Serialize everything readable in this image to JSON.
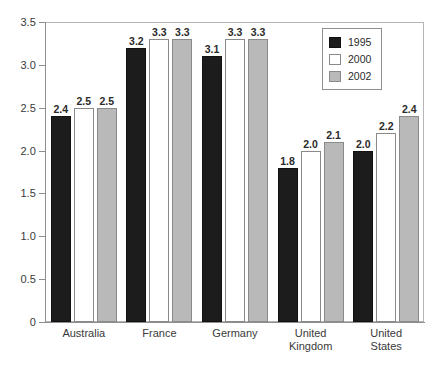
{
  "chart_data": {
    "type": "bar",
    "title": "",
    "subtitle": "",
    "xlabel": "",
    "ylabel": "",
    "ylim": [
      0,
      3.5
    ],
    "ytick_labels": [
      "0",
      "0.5",
      "1.0",
      "1.5",
      "2.0",
      "2.5",
      "3.0",
      "3.5"
    ],
    "ytick_values": [
      0,
      0.5,
      1.0,
      1.5,
      2.0,
      2.5,
      3.0,
      3.5
    ],
    "grid": false,
    "legend_position": "top-right",
    "categories": [
      "Australia",
      "France",
      "Germany",
      "United\nKingdom",
      "United\nStates"
    ],
    "series": [
      {
        "name": "1995",
        "color": "#1c1c1c",
        "values": [
          2.4,
          3.2,
          3.1,
          1.8,
          2.0
        ],
        "labels": [
          "2.4",
          "3.2",
          "3.1",
          "1.8",
          "2.0"
        ]
      },
      {
        "name": "2000",
        "color": "#ffffff",
        "values": [
          2.5,
          3.3,
          3.3,
          2.0,
          2.2
        ],
        "labels": [
          "2.5",
          "3.3",
          "3.3",
          "2.0",
          "2.2"
        ]
      },
      {
        "name": "2002",
        "color": "#b9b9b9",
        "values": [
          2.5,
          3.3,
          3.3,
          2.1,
          2.4
        ],
        "labels": [
          "2.5",
          "3.3",
          "3.3",
          "2.1",
          "2.4"
        ]
      }
    ]
  },
  "legend": {
    "entries": [
      {
        "label": "1995",
        "swatch": "black-swatch"
      },
      {
        "label": "2000",
        "swatch": "white-swatch"
      },
      {
        "label": "2002",
        "swatch": "gray-swatch"
      }
    ]
  }
}
